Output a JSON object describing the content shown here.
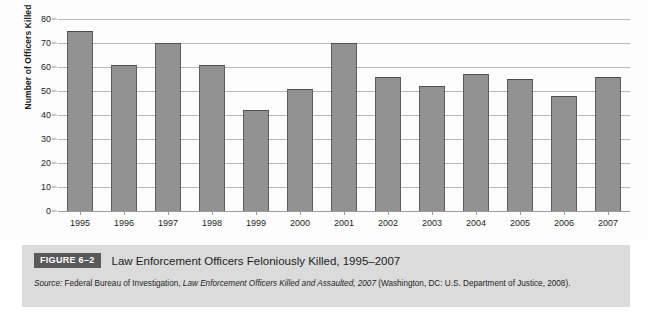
{
  "figure": {
    "badge_label": "FIGURE 6–2",
    "title": "Law Enforcement Officers Feloniously Killed, 1995–2007",
    "source_label": "Source:",
    "source_text_1": " Federal Bureau of Investigation, ",
    "source_title": "Law Enforcement Officers Killed and Assaulted, 2007",
    "source_text_2": " (Washington, DC: U.S. Department of Justice, 2008)."
  },
  "colors": {
    "bar_fill": "#919191",
    "bar_edge": "#5d5d5d",
    "gridline": "#b9b9b9",
    "caption_background": "#dbdbdb",
    "badge_background": "#5a5a5a",
    "page_background": "#ffffff"
  },
  "chart_data": {
    "type": "bar",
    "title": "Law Enforcement Officers Feloniously Killed, 1995–2007",
    "xlabel": "",
    "ylabel": "Number of Officers Killed",
    "categories": [
      "1995",
      "1996",
      "1997",
      "1998",
      "1999",
      "2000",
      "2001",
      "2002",
      "2003",
      "2004",
      "2005",
      "2006",
      "2007"
    ],
    "values": [
      75,
      61,
      70,
      61,
      42,
      51,
      70,
      56,
      52,
      57,
      55,
      48,
      56
    ],
    "ylim": [
      0,
      80
    ],
    "yticks": [
      0,
      10,
      20,
      30,
      40,
      50,
      60,
      70,
      80
    ],
    "ytick_labels": [
      "0",
      "10",
      "20",
      "30",
      "40",
      "50",
      "60",
      "70",
      "80"
    ],
    "grid": true,
    "legend": false,
    "legend_position": "none"
  }
}
